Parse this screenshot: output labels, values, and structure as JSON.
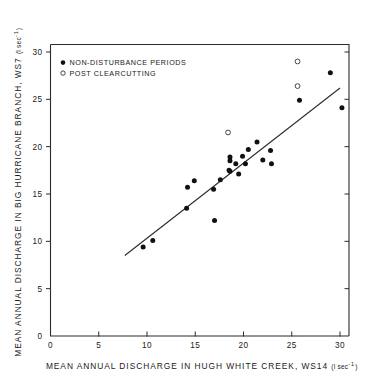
{
  "chart_data": {
    "type": "scatter",
    "title": "",
    "xlabel": "MEAN ANNUAL DISCHARGE IN HUGH WHITE CREEK, WS14 (l sec-1)",
    "ylabel": "MEAN ANNUAL DISCHARGE IN BIG HURRICANE BRANCH, WS7 (l sec-1)",
    "xlabel_main": "MEAN ANNUAL DISCHARGE IN HUGH WHITE CREEK, WS14",
    "xlabel_unit": "(l sec",
    "xlabel_unit_sup": "-1",
    "xlabel_unit_close": ")",
    "ylabel_main": "MEAN ANNUAL DISCHARGE IN BIG HURRICANE BRANCH, WS7",
    "ylabel_unit": "(l sec",
    "ylabel_unit_sup": "-1",
    "ylabel_unit_close": ")",
    "xlim": [
      0,
      31
    ],
    "ylim": [
      0,
      31.5
    ],
    "xticks": [
      0,
      5,
      10,
      15,
      20,
      25,
      30
    ],
    "yticks": [
      0,
      5,
      10,
      15,
      20,
      25,
      30
    ],
    "xticklabels": [
      "0",
      "5",
      "10",
      "15",
      "20",
      "25",
      "30"
    ],
    "yticklabels": [
      "0",
      "5",
      "10",
      "15",
      "20",
      "25",
      "30"
    ],
    "grid": false,
    "legend_position": "upper-left",
    "series": [
      {
        "name": "NON-DISTURBANCE PERIODS",
        "marker": "filled-circle",
        "color": "#111111",
        "points": [
          [
            9.6,
            9.4
          ],
          [
            10.6,
            10.1
          ],
          [
            14.1,
            13.5
          ],
          [
            14.2,
            15.7
          ],
          [
            14.9,
            16.4
          ],
          [
            16.9,
            15.5
          ],
          [
            17.0,
            12.2
          ],
          [
            17.6,
            16.5
          ],
          [
            18.5,
            17.5
          ],
          [
            18.6,
            18.9
          ],
          [
            18.6,
            18.5
          ],
          [
            18.6,
            17.4
          ],
          [
            19.2,
            18.2
          ],
          [
            19.5,
            17.1
          ],
          [
            19.9,
            19.0
          ],
          [
            20.2,
            18.2
          ],
          [
            20.5,
            19.7
          ],
          [
            21.4,
            20.5
          ],
          [
            22.0,
            18.6
          ],
          [
            22.8,
            19.6
          ],
          [
            22.9,
            18.2
          ],
          [
            25.8,
            24.9
          ],
          [
            29.0,
            27.8
          ],
          [
            30.2,
            24.1
          ]
        ]
      },
      {
        "name": "POST CLEARCUTTING",
        "marker": "open-circle",
        "color": "#ffffff",
        "points": [
          [
            18.4,
            21.5
          ],
          [
            25.6,
            29.0
          ],
          [
            25.6,
            26.4
          ]
        ]
      }
    ],
    "fit_line": {
      "name": "regression-line",
      "x0": 7.7,
      "y0": 8.5,
      "x1": 30.0,
      "y1": 26.2
    },
    "legend": [
      {
        "label": "NON-DISTURBANCE PERIODS",
        "marker": "filled-circle"
      },
      {
        "label": "POST CLEARCUTTING",
        "marker": "open-circle"
      }
    ]
  }
}
